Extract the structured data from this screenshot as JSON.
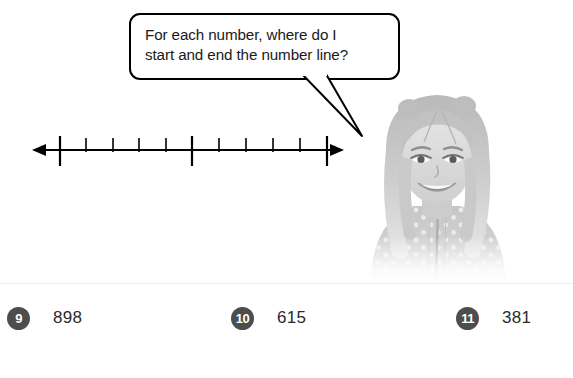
{
  "speech_bubble": {
    "text": "For each number, where do I\nstart and end the number line?",
    "tail_target": "student-photo"
  },
  "number_line": {
    "label": "blank number line with tick marks",
    "arrow_left": true,
    "arrow_right": true,
    "tick_count": 11,
    "major_tick_indices": [
      0,
      5,
      10
    ],
    "ticks": [
      {
        "index": 0,
        "type": "major"
      },
      {
        "index": 1,
        "type": "minor"
      },
      {
        "index": 2,
        "type": "minor"
      },
      {
        "index": 3,
        "type": "minor"
      },
      {
        "index": 4,
        "type": "minor"
      },
      {
        "index": 5,
        "type": "major"
      },
      {
        "index": 6,
        "type": "minor"
      },
      {
        "index": 7,
        "type": "minor"
      },
      {
        "index": 8,
        "type": "minor"
      },
      {
        "index": 9,
        "type": "minor"
      },
      {
        "index": 10,
        "type": "major"
      }
    ]
  },
  "photo": {
    "alt": "grayscale photo of a smiling girl with long blonde hair wearing a polka-dot zip-up top"
  },
  "answers": {
    "items": [
      {
        "number": "9",
        "value": "898"
      },
      {
        "number": "10",
        "value": "615"
      },
      {
        "number": "11",
        "value": "381"
      }
    ]
  },
  "colors": {
    "badge_background": "#4d4d4d",
    "badge_text": "#ffffff",
    "text": "#2b2b2b",
    "line": "#000000",
    "divider": "#ededed",
    "page_background": "#ffffff"
  }
}
